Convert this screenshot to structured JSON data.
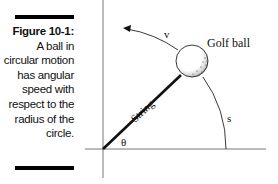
{
  "caption": {
    "label": "Figure 10-1:",
    "text": "A ball in circular motion has angular speed with respect to the radius of the circle."
  },
  "diagram": {
    "labels": {
      "ball": "Golf ball",
      "string": "String",
      "velocity": "v",
      "arc_length": "s",
      "angle": "θ"
    },
    "colors": {
      "line": "#111111",
      "axis": "#777777",
      "ball_fill": "#ffffff"
    }
  }
}
